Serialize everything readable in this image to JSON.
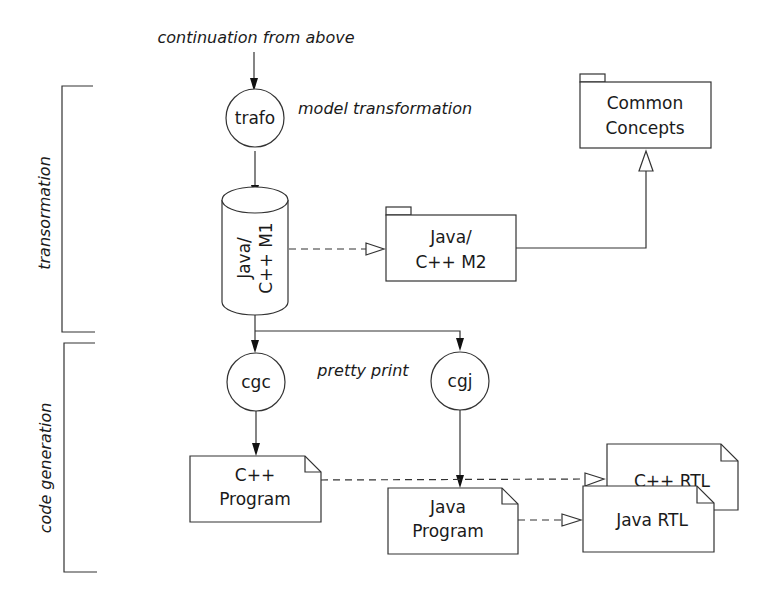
{
  "annotations": {
    "continuation": "continuation from above",
    "model_transformation": "model transformation",
    "pretty_print": "pretty print"
  },
  "phases": {
    "transformation": "transormation",
    "code_generation": "code generation"
  },
  "nodes": {
    "trafo": "trafo",
    "cgc": "cgc",
    "cgj": "cgj",
    "m1_line1": "Java/",
    "m1_line2": "C++ M1",
    "m2_line1": "Java/",
    "m2_line2": "C++ M2",
    "common_line1": "Common",
    "common_line2": "Concepts",
    "cpp_program_line1": "C++",
    "cpp_program_line2": "Program",
    "java_program_line1": "Java",
    "java_program_line2": "Program",
    "cpp_rtl": "C++ RTL",
    "java_rtl": "Java RTL"
  },
  "colors": {
    "stroke": "#333333",
    "text": "#1a1a1a",
    "background": "#ffffff"
  }
}
